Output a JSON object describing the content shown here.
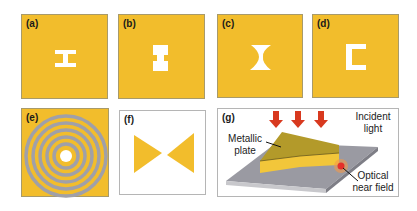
{
  "panels": {
    "a": {
      "label": "(a)",
      "shape": "H-shaped aperture (horizontal)"
    },
    "b": {
      "label": "(b)",
      "shape": "H-shaped aperture (vertical)"
    },
    "c": {
      "label": "(c)",
      "shape": "bowtie aperture"
    },
    "d": {
      "label": "(d)",
      "shape": "C-shaped aperture"
    },
    "e": {
      "label": "(e)",
      "shape": "bull's-eye concentric rings"
    },
    "f": {
      "label": "(f)",
      "shape": "bowtie antenna"
    },
    "g": {
      "label": "(g)",
      "incident_light_line1": "Incident",
      "incident_light_line2": "light",
      "plate_line1": "Metallic",
      "plate_line2": "plate",
      "near_field_line1": "Optical",
      "near_field_line2": "near field"
    }
  },
  "colors": {
    "gold": "#f2bd2c",
    "ring_gray": "#a0a0a8",
    "arrow_red": "#d8391f",
    "substrate": "#9a9aa2"
  }
}
